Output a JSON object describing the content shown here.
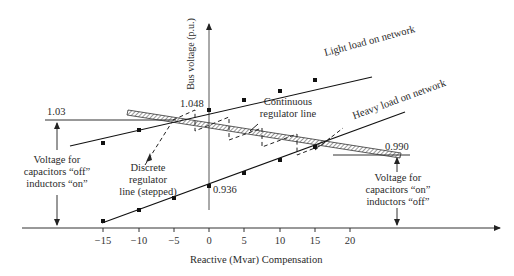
{
  "diagram": {
    "y_axis_label": "Bus voltage (p.u.)",
    "x_axis_label": "Reactive (Mvar) Compensation",
    "x_ticks": [
      "−15",
      "−10",
      "−5",
      "0",
      "5",
      "10",
      "15",
      "20"
    ],
    "value_labels": {
      "v_1_03": "1.03",
      "v_1_048": "1.048",
      "v_0_990": "0.990",
      "v_0_936": "0.936"
    },
    "line_labels": {
      "light_load": "Light load on network",
      "heavy_load": "Heavy load on network",
      "continuous_line1": "Continuous",
      "continuous_line2": "regulator line",
      "discrete_line1": "Discrete",
      "discrete_line2": "regulator",
      "discrete_line3": "line (stepped)"
    },
    "annotations": {
      "left_line1": "Voltage for",
      "left_line2": "capacitors “off”",
      "left_line3": "inductors “on”",
      "right_line1": "Voltage for",
      "right_line2": "capacitors “on”",
      "right_line3": "inductors “off”"
    },
    "colors": {
      "line": "#1a1a1a",
      "axis": "#333333",
      "background": "#ffffff"
    }
  }
}
